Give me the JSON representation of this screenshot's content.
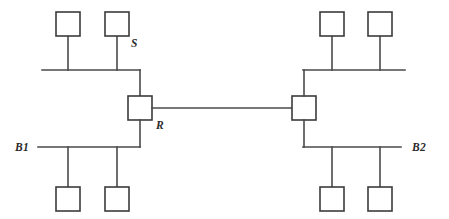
{
  "diagram": {
    "type": "network-topology",
    "background_color": "#ffffff",
    "line_color": "#4a4a4a",
    "box_stroke_color": "#3b3b3b",
    "box_fill_color": "#ffffff",
    "label_color": "#2b2b2b",
    "labels": {
      "sender": "S",
      "router": "R",
      "bus_left": "B1",
      "bus_right": "B2"
    },
    "segments": [
      {
        "id": "left-top",
        "bus_label": "",
        "host_count": 2,
        "has_labeled_host": true,
        "labeled_host": "S"
      },
      {
        "id": "left-bottom",
        "bus_label": "B1",
        "host_count": 2,
        "has_labeled_host": false,
        "labeled_host": ""
      },
      {
        "id": "right-top",
        "bus_label": "",
        "host_count": 2,
        "has_labeled_host": false,
        "labeled_host": ""
      },
      {
        "id": "right-bottom",
        "bus_label": "B2",
        "host_count": 2,
        "has_labeled_host": false,
        "labeled_host": ""
      }
    ],
    "routers": [
      {
        "id": "router-left",
        "label": "R"
      },
      {
        "id": "router-right",
        "label": ""
      }
    ],
    "host_total": 8,
    "router_total": 2
  }
}
